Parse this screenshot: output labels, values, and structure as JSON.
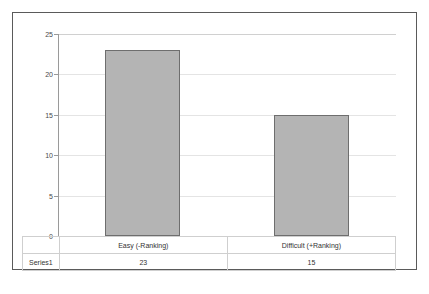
{
  "chart_data": {
    "type": "bar",
    "title": "",
    "xlabel": "",
    "ylabel": "",
    "categories": [
      "Easy (-Ranking)",
      "Difficult (+Ranking)"
    ],
    "series": [
      {
        "name": "Series1",
        "values": [
          23,
          15
        ]
      }
    ],
    "ylim": [
      0,
      25
    ],
    "yticks": [
      0,
      5,
      10,
      15,
      20,
      25
    ],
    "ytick_labels": [
      "0",
      "5",
      "10",
      "15",
      "20",
      "25"
    ],
    "grid": true,
    "legend": "none",
    "data_table_visible": true,
    "bar_fill_color": "#b4b4b4",
    "bar_border_color": "#6e6e6e",
    "gridline_color": "#e4e4e4",
    "axis_color": "#9a9a9a",
    "frame_color": "#5a5a5a",
    "table_border_color": "#cfcfcf"
  },
  "data_table": {
    "series_label": "Series1",
    "columns": [
      "Easy (-Ranking)",
      "Difficult (+Ranking)"
    ],
    "row_values": [
      "23",
      "15"
    ]
  }
}
